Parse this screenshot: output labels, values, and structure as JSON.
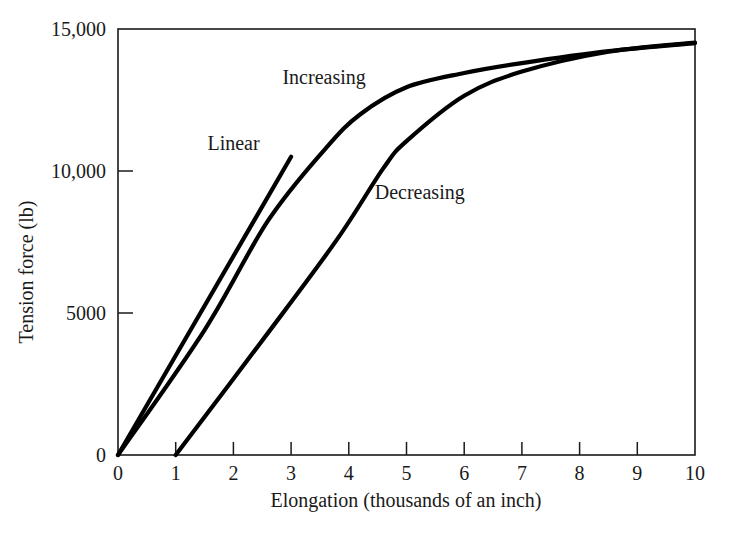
{
  "chart_data": {
    "type": "line",
    "title": "",
    "subtitle": "",
    "xlabel": "Elongation (thousands of an inch)",
    "ylabel": "Tension force (lb)",
    "xlim": [
      0,
      10
    ],
    "ylim": [
      0,
      15000
    ],
    "grid": false,
    "legend_position": "inline-annotations",
    "x_ticks": [
      0,
      1,
      2,
      3,
      4,
      5,
      6,
      7,
      8,
      9,
      10
    ],
    "x_tick_labels": [
      "0",
      "1",
      "2",
      "3",
      "4",
      "5",
      "6",
      "7",
      "8",
      "9",
      "10"
    ],
    "y_ticks": [
      0,
      5000,
      10000,
      15000
    ],
    "y_tick_labels": [
      "0",
      "5000",
      "10,000",
      "15,000"
    ],
    "line_color": "#000000",
    "series": [
      {
        "name": "Linear",
        "label_text": "Linear",
        "label_x": 1.55,
        "label_y": 10750,
        "points": [
          {
            "x": 0.0,
            "y": 0
          },
          {
            "x": 3.0,
            "y": 10500
          }
        ]
      },
      {
        "name": "Increasing",
        "label_text": "Increasing",
        "label_x": 2.85,
        "label_y": 13050,
        "points": [
          {
            "x": 0.0,
            "y": 0
          },
          {
            "x": 1.5,
            "y": 4400
          },
          {
            "x": 2.6,
            "y": 8250
          },
          {
            "x": 3.6,
            "y": 10800
          },
          {
            "x": 4.2,
            "y": 12000
          },
          {
            "x": 5.0,
            "y": 12950
          },
          {
            "x": 6.0,
            "y": 13450
          },
          {
            "x": 7.0,
            "y": 13800
          },
          {
            "x": 8.5,
            "y": 14220
          },
          {
            "x": 10.0,
            "y": 14500
          }
        ]
      },
      {
        "name": "Decreasing",
        "label_text": "Decreasing",
        "label_x": 4.45,
        "label_y": 9000,
        "points": [
          {
            "x": 1.0,
            "y": 0
          },
          {
            "x": 2.6,
            "y": 4300
          },
          {
            "x": 3.8,
            "y": 7600
          },
          {
            "x": 4.6,
            "y": 10100
          },
          {
            "x": 5.0,
            "y": 11050
          },
          {
            "x": 6.0,
            "y": 12650
          },
          {
            "x": 7.0,
            "y": 13500
          },
          {
            "x": 8.5,
            "y": 14200
          },
          {
            "x": 10.0,
            "y": 14520
          }
        ]
      }
    ]
  }
}
